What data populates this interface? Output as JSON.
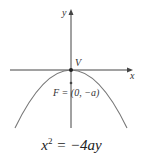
{
  "diagram": {
    "type": "parabola-opening-downward",
    "labels": {
      "y_axis": "y",
      "x_axis": "x",
      "vertex": "V",
      "focus": "F = (0, −a)"
    },
    "equation": {
      "base": "x",
      "exponent": "2",
      "rest": " = −4ay"
    },
    "colors": {
      "axis": "#444444",
      "curve": "#777777",
      "text": "#333333"
    }
  }
}
